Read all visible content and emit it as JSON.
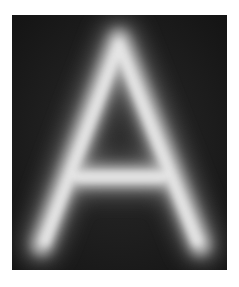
{
  "image": {
    "subject": "glowing letter",
    "letter": "A",
    "background_color": "#1b1b1b",
    "glow_color": "#e8e8e8",
    "border_color": "#ffffff"
  }
}
